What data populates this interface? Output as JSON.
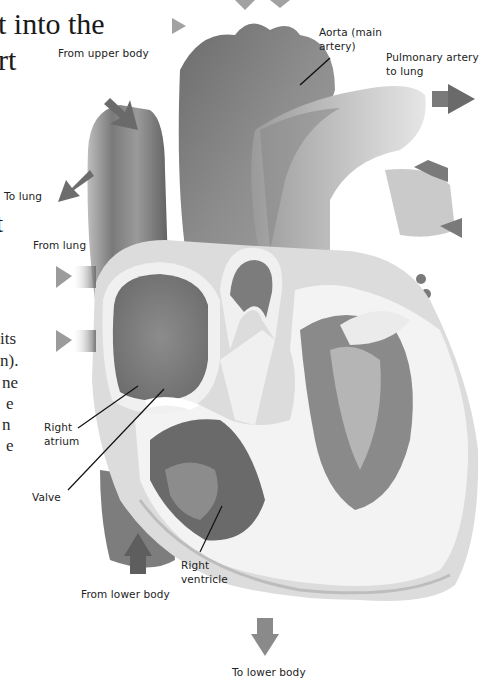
{
  "page": {
    "heading_lines": [
      "t into the",
      "rt"
    ],
    "heading_fragment_mid": "t",
    "body_fragments": [
      "its",
      "n).",
      "ne",
      "e",
      "n",
      "e"
    ]
  },
  "diagram": {
    "style": "grayscale illustration",
    "labels": {
      "from_upper_body": "From upper body",
      "aorta": "Aorta (main artery)",
      "aorta_line1": "Aorta (main",
      "aorta_line2": "artery)",
      "pulmonary_artery": "Pulmonary artery to lung",
      "pulmonary_line1": "Pulmonary artery",
      "pulmonary_line2": "to lung",
      "to_lung": "To lung",
      "from_lung": "From lung",
      "right_atrium_line1": "Right",
      "right_atrium_line2": "atrium",
      "valve": "Valve",
      "right_ventricle_line1": "Right",
      "right_ventricle_line2": "ventricle",
      "from_lower_body": "From lower body",
      "to_lower_body": "To lower body"
    },
    "arrows": [
      {
        "name": "from-upper-body",
        "direction": "down-right"
      },
      {
        "name": "to-lung-left",
        "direction": "down-left"
      },
      {
        "name": "from-lung-left-1",
        "direction": "right"
      },
      {
        "name": "from-lung-left-2",
        "direction": "right"
      },
      {
        "name": "pulmonary-to-lung-right",
        "direction": "right"
      },
      {
        "name": "from-lung-right-1",
        "direction": "left"
      },
      {
        "name": "from-lung-right-2",
        "direction": "left"
      },
      {
        "name": "from-lower-body",
        "direction": "up"
      },
      {
        "name": "to-lower-body",
        "direction": "down"
      }
    ],
    "colors": {
      "dark_gray": "#5a5a5a",
      "mid_gray": "#8a8a8a",
      "light_gray": "#c8c8c8",
      "muscle_white": "#f2f2f2",
      "label_text": "#222222"
    }
  }
}
